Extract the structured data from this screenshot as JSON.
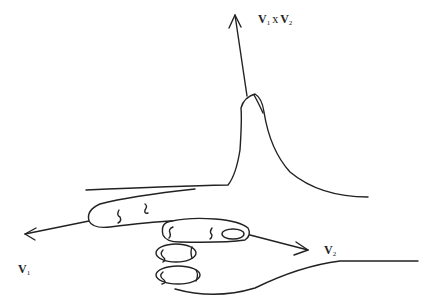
{
  "diagram": {
    "type": "right-hand-rule",
    "labels": {
      "v1": {
        "symbol": "V",
        "subscript": "1"
      },
      "v2": {
        "symbol": "V",
        "subscript": "2"
      },
      "cross": {
        "left_symbol": "V",
        "left_subscript": "1",
        "operator": "x",
        "right_symbol": "V",
        "right_subscript": "2"
      }
    },
    "arrows": [
      {
        "name": "v1-arrow",
        "direction": "left",
        "label": "V1"
      },
      {
        "name": "v2-arrow",
        "direction": "right-down",
        "label": "V2"
      },
      {
        "name": "cross-product-arrow",
        "direction": "up",
        "label": "V1 x V2"
      }
    ],
    "colors": {
      "stroke": "#222222",
      "background": "#ffffff"
    }
  }
}
